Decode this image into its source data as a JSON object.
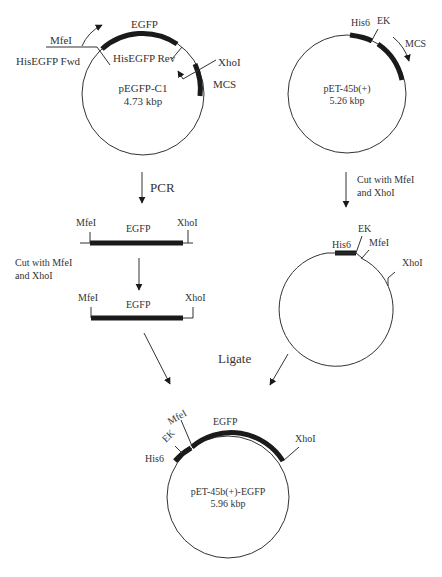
{
  "plasmids": {
    "pegfp": {
      "name": "pEGFP-C1",
      "size": "4.73 kbp",
      "gene": "EGFP",
      "site_mfei": "MfeI",
      "site_xhoi": "XhoI",
      "mcs": "MCS",
      "primer_fwd": "HisEGFP Fwd",
      "primer_rev": "HisEGFP Rev"
    },
    "pet45": {
      "name": "pET-45b(+)",
      "size": "5.26 kbp",
      "his6": "His6",
      "ek": "EK",
      "mcs": "MCS"
    },
    "pet45_cut": {
      "his6": "His6",
      "ek": "EK",
      "site_mfei": "MfeI",
      "site_xhoi": "XhoI"
    },
    "product": {
      "name": "pET-45b(+)-EGFP",
      "size": "5.96 kbp",
      "his6": "His6",
      "ek": "EK",
      "site_mfei": "MfeI",
      "gene": "EGFP",
      "site_xhoi": "XhoI"
    }
  },
  "fragments": {
    "pcr": {
      "left": "MfeI",
      "gene": "EGFP",
      "right": "XhoI"
    },
    "cut": {
      "left": "MfeI",
      "gene": "EGFP",
      "right": "XhoI"
    }
  },
  "steps": {
    "pcr": "PCR",
    "cut_left_1": "Cut with MfeI",
    "cut_left_2": "and XhoI",
    "cut_right_1": "Cut with MfeI",
    "cut_right_2": "and XhoI",
    "ligate": "Ligate"
  }
}
